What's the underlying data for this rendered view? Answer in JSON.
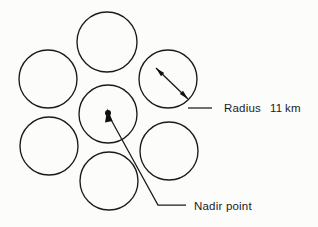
{
  "figure": {
    "kind": "swath-footprint-diagram",
    "background_color": "#fcfcfb",
    "stroke_color": "#1a1a1a",
    "width": 318,
    "height": 227
  },
  "circles": [
    {
      "name": "footprint-top",
      "cx": 107,
      "cy": 42,
      "r": 30
    },
    {
      "name": "footprint-upper-left",
      "cx": 48,
      "cy": 79,
      "r": 29
    },
    {
      "name": "footprint-upper-right",
      "cx": 168,
      "cy": 79,
      "r": 29
    },
    {
      "name": "footprint-center",
      "cx": 108,
      "cy": 114,
      "r": 29
    },
    {
      "name": "footprint-lower-left",
      "cx": 49,
      "cy": 146,
      "r": 29
    },
    {
      "name": "footprint-lower-right",
      "cx": 169,
      "cy": 151,
      "r": 29
    },
    {
      "name": "footprint-bottom",
      "cx": 109,
      "cy": 181,
      "r": 29
    }
  ],
  "annotations": {
    "radius": {
      "label": "Radius",
      "value": "11",
      "unit": "km",
      "full_text": "Radius    11 km",
      "label_x": 224,
      "value_x": 270,
      "unit_x": 285,
      "text_y": 109,
      "leader_path": "M 188 108 L 212 108",
      "dim_path": "M 156 68 L 188 99",
      "arrow_tip_inner": "156,68",
      "arrow_tip_outer": "188,99"
    },
    "nadir": {
      "label": "Nadir point",
      "text_x": 194,
      "text_y": 207,
      "dot_x": 108,
      "dot_y": 113,
      "dot_r": 3,
      "leader_path": "M 109 116 L 158 205 L 186 205"
    }
  }
}
